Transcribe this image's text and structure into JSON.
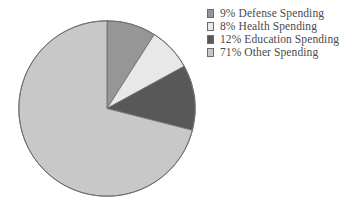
{
  "chart_data": {
    "type": "pie",
    "title": "",
    "subtitle": "",
    "xlabel": "",
    "ylabel": "",
    "grid": false,
    "legend_position": "right",
    "start_angle_oclock": 12,
    "direction": "clockwise",
    "categories": [
      "Defense Spending",
      "Health Spending",
      "Education Spending",
      "Other Spending"
    ],
    "values": [
      9,
      8,
      12,
      71
    ],
    "value_unit": "percent",
    "slices": [
      {
        "label": "Defense Spending",
        "value": 9,
        "value_text": "9%",
        "legend_text": "9% Defense Spending",
        "color": "#969696"
      },
      {
        "label": "Health Spending",
        "value": 8,
        "value_text": "8%",
        "legend_text": "8% Health Spending",
        "color": "#e8e8e8"
      },
      {
        "label": "Education Spending",
        "value": 12,
        "value_text": "12%",
        "legend_text": "12% Education Spending",
        "color": "#585858"
      },
      {
        "label": "Other Spending",
        "value": 71,
        "value_text": "71%",
        "legend_text": "71% Other Spending",
        "color": "#c8c8c8"
      }
    ],
    "outline_color": "#707070",
    "background_color": "#ffffff"
  },
  "legend": {
    "items": [
      {
        "swatch_name": "legend-swatch-defense",
        "text": "9% Defense Spending"
      },
      {
        "swatch_name": "legend-swatch-health",
        "text": "8% Health Spending"
      },
      {
        "swatch_name": "legend-swatch-education",
        "text": "12% Education Spending"
      },
      {
        "swatch_name": "legend-swatch-other",
        "text": "71% Other Spending"
      }
    ]
  }
}
